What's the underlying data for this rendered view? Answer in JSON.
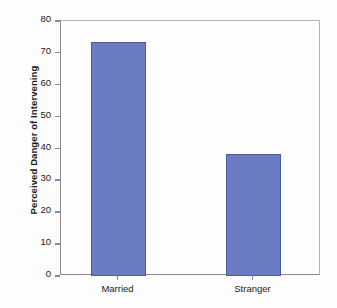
{
  "chart_data": {
    "type": "bar",
    "title": "",
    "xlabel": "",
    "ylabel": "Perceived Danger of Intervening",
    "categories": [
      "Married",
      "Stranger"
    ],
    "values": [
      73.5,
      38.4
    ],
    "ylim": [
      0,
      80
    ],
    "ytick_labels": [
      "0",
      "10",
      "20",
      "30",
      "40",
      "50",
      "60",
      "70",
      "80"
    ],
    "ytick_values": [
      0,
      10,
      20,
      30,
      40,
      50,
      60,
      70,
      80
    ],
    "grid": false,
    "legend": "none",
    "bar_color": "#6b7bc4",
    "bar_border_color": "#4a5a9e",
    "axis_color": "#8a8a8a",
    "background_color": "#fdfdfd",
    "text_color": "#1a1a1a"
  }
}
